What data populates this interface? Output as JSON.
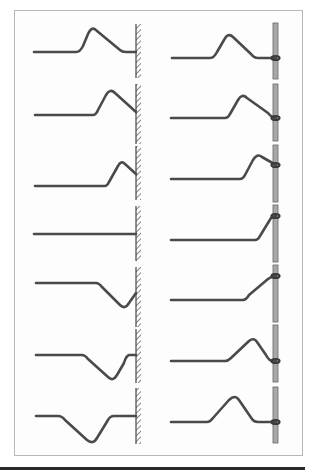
{
  "title": "",
  "colors": {
    "string": "#4a4a4a",
    "wall_hatch": "#555555",
    "rod_fill": "#a8a8a8",
    "rod_edge": "#666666",
    "frame": "#b8b8b8"
  },
  "diagram": {
    "columns": [
      {
        "id": "fixed-end",
        "boundary": "hatched-wall",
        "frames": [
          {
            "step": 1,
            "pulse": "upright",
            "position": "approaching"
          },
          {
            "step": 2,
            "pulse": "upright",
            "position": "near-wall"
          },
          {
            "step": 3,
            "pulse": "upright",
            "position": "at-wall"
          },
          {
            "step": 4,
            "pulse": "cancelled",
            "position": "at-wall"
          },
          {
            "step": 5,
            "pulse": "inverted",
            "position": "at-wall"
          },
          {
            "step": 6,
            "pulse": "inverted",
            "position": "leaving"
          },
          {
            "step": 7,
            "pulse": "inverted",
            "position": "reflected"
          }
        ]
      },
      {
        "id": "free-end",
        "boundary": "ring-on-rod",
        "frames": [
          {
            "step": 1,
            "pulse": "upright",
            "position": "approaching"
          },
          {
            "step": 2,
            "pulse": "upright",
            "position": "near-rod"
          },
          {
            "step": 3,
            "pulse": "upright",
            "position": "at-rod"
          },
          {
            "step": 4,
            "pulse": "doubled",
            "position": "at-rod"
          },
          {
            "step": 5,
            "pulse": "upright",
            "position": "at-rod"
          },
          {
            "step": 6,
            "pulse": "upright",
            "position": "leaving"
          },
          {
            "step": 7,
            "pulse": "upright",
            "position": "reflected"
          }
        ]
      }
    ]
  }
}
